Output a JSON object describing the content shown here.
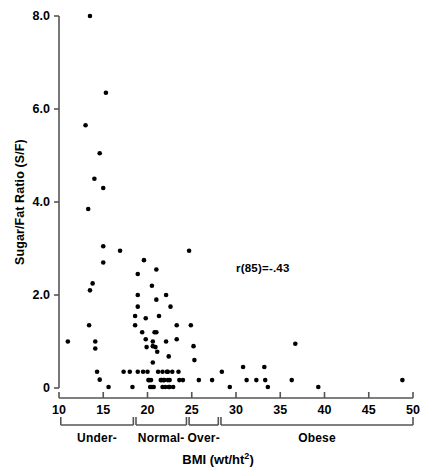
{
  "chart_data": {
    "type": "scatter",
    "title": "",
    "xlabel": "BMI (wt/ht2)",
    "xlabel_base": "BMI (wt/ht",
    "xlabel_exponent": "2",
    "xlabel_close": ")",
    "ylabel": "Sugar/Fat Ratio (S/F)",
    "xlim": [
      10,
      50
    ],
    "ylim": [
      0,
      8.0
    ],
    "grid": false,
    "legend": "none",
    "xticks": [
      10,
      15,
      20,
      25,
      30,
      35,
      40,
      45,
      50
    ],
    "xtick_labels": [
      "10",
      "15",
      "20",
      "25",
      "30",
      "35",
      "40",
      "45",
      "50"
    ],
    "yticks": [
      0,
      2.0,
      4.0,
      6.0,
      8.0
    ],
    "ytick_labels": [
      "0",
      "2.0",
      "4.0",
      "6.0",
      "8.0"
    ],
    "annotations": [
      {
        "text": "r(85)=-.43",
        "x": 33.0,
        "y": 2.55
      }
    ],
    "marker": {
      "shape": "circle",
      "size_px": 3.4,
      "color": "#000000"
    },
    "n_points": 87,
    "points": [
      [
        11.0,
        1.0
      ],
      [
        13.5,
        8.0
      ],
      [
        13.0,
        5.65
      ],
      [
        15.3,
        6.35
      ],
      [
        14.6,
        5.05
      ],
      [
        14.0,
        4.5
      ],
      [
        15.0,
        4.3
      ],
      [
        13.3,
        3.85
      ],
      [
        15.0,
        3.05
      ],
      [
        13.8,
        2.25
      ],
      [
        13.5,
        2.1
      ],
      [
        15.0,
        2.7
      ],
      [
        13.4,
        1.35
      ],
      [
        14.1,
        1.0
      ],
      [
        14.1,
        0.85
      ],
      [
        14.3,
        0.35
      ],
      [
        14.6,
        0.18
      ],
      [
        15.6,
        0.02
      ],
      [
        16.9,
        2.95
      ],
      [
        17.3,
        0.35
      ],
      [
        18.0,
        0.35
      ],
      [
        18.3,
        0.02
      ],
      [
        18.6,
        1.55
      ],
      [
        18.6,
        1.35
      ],
      [
        18.9,
        2.45
      ],
      [
        18.9,
        2.0
      ],
      [
        18.9,
        1.75
      ],
      [
        18.9,
        0.35
      ],
      [
        19.4,
        1.2
      ],
      [
        19.5,
        0.35
      ],
      [
        19.6,
        2.75
      ],
      [
        19.8,
        1.5
      ],
      [
        19.8,
        1.05
      ],
      [
        19.9,
        0.88
      ],
      [
        20.0,
        0.35
      ],
      [
        20.1,
        0.17
      ],
      [
        20.2,
        0.17
      ],
      [
        20.3,
        0.02
      ],
      [
        20.4,
        0.17
      ],
      [
        20.5,
        2.2
      ],
      [
        20.5,
        0.02
      ],
      [
        20.6,
        1.0
      ],
      [
        20.6,
        0.9
      ],
      [
        20.6,
        0.55
      ],
      [
        20.7,
        0.02
      ],
      [
        20.8,
        1.2
      ],
      [
        20.9,
        0.88
      ],
      [
        21.0,
        2.55
      ],
      [
        21.0,
        1.9
      ],
      [
        21.0,
        1.2
      ],
      [
        21.1,
        0.78
      ],
      [
        21.2,
        0.35
      ],
      [
        21.3,
        1.55
      ],
      [
        21.5,
        0.17
      ],
      [
        21.6,
        0.17
      ],
      [
        21.7,
        0.35
      ],
      [
        21.7,
        0.02
      ],
      [
        21.8,
        0.17
      ],
      [
        21.9,
        0.17
      ],
      [
        22.0,
        0.02
      ],
      [
        22.1,
        2.0
      ],
      [
        22.1,
        1.0
      ],
      [
        22.2,
        0.35
      ],
      [
        22.3,
        0.35
      ],
      [
        22.3,
        0.17
      ],
      [
        22.4,
        0.68
      ],
      [
        22.4,
        0.02
      ],
      [
        22.5,
        0.17
      ],
      [
        22.5,
        0.02
      ],
      [
        22.6,
        1.75
      ],
      [
        22.8,
        0.35
      ],
      [
        22.9,
        0.02
      ],
      [
        23.3,
        1.35
      ],
      [
        23.3,
        1.05
      ],
      [
        23.5,
        0.35
      ],
      [
        23.6,
        0.17
      ],
      [
        24.0,
        0.17
      ],
      [
        24.7,
        2.95
      ],
      [
        24.9,
        1.35
      ],
      [
        25.2,
        0.9
      ],
      [
        25.3,
        0.6
      ],
      [
        25.8,
        0.17
      ],
      [
        27.3,
        0.17
      ],
      [
        28.4,
        0.35
      ],
      [
        29.3,
        0.02
      ],
      [
        30.8,
        0.45
      ],
      [
        31.2,
        0.17
      ],
      [
        32.3,
        0.17
      ],
      [
        33.2,
        0.45
      ],
      [
        33.3,
        0.17
      ],
      [
        33.6,
        0.02
      ],
      [
        36.3,
        0.17
      ],
      [
        36.7,
        0.95
      ],
      [
        39.3,
        0.02
      ],
      [
        48.8,
        0.17
      ]
    ],
    "categories": [
      {
        "label": "Under-",
        "x_start": 10.2,
        "x_end": 18.4
      },
      {
        "label": "Normal-",
        "x_start": 18.7,
        "x_end": 24.4
      },
      {
        "label": "Over-",
        "x_start": 24.7,
        "x_end": 28.0
      },
      {
        "label": "Obese",
        "x_start": 28.3,
        "x_end": 50.0
      }
    ]
  },
  "caption": {
    "text": ""
  }
}
